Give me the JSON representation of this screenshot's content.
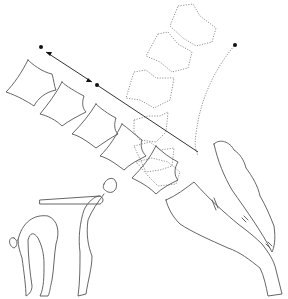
{
  "diagram": {
    "title": "",
    "colors": {
      "background": "#ffffff",
      "outline": "#555555",
      "dotted_outline": "#777777",
      "points": "#111111"
    },
    "elements": {
      "flexed_vertebrae": 5,
      "extended_vertebrae_dotted": 6,
      "points": 3,
      "figures": [
        "forward-bend-figure",
        "standing-flexion-figure"
      ]
    }
  }
}
